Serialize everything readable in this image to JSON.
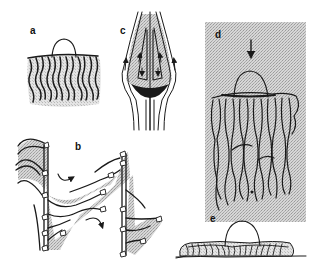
{
  "figure": {
    "panels": [
      {
        "id": "a",
        "label": "a",
        "description": "dome cell atop fibrous bundle"
      },
      {
        "id": "b",
        "label": "b",
        "description": "zig-zag folded tubular structures with flow arrows"
      },
      {
        "id": "c",
        "label": "c",
        "description": "flow lines around bulb with internal circulation arrows"
      },
      {
        "id": "d",
        "label": "d",
        "description": "dome on long fibrous strands, arrow pointing down, shaded background"
      },
      {
        "id": "e",
        "label": "e",
        "description": "dome on flattened fibrous base on ground line"
      }
    ],
    "colors": {
      "ink": "#1a1a1a",
      "shade": "#c8c8c8",
      "background": "#ffffff"
    }
  }
}
